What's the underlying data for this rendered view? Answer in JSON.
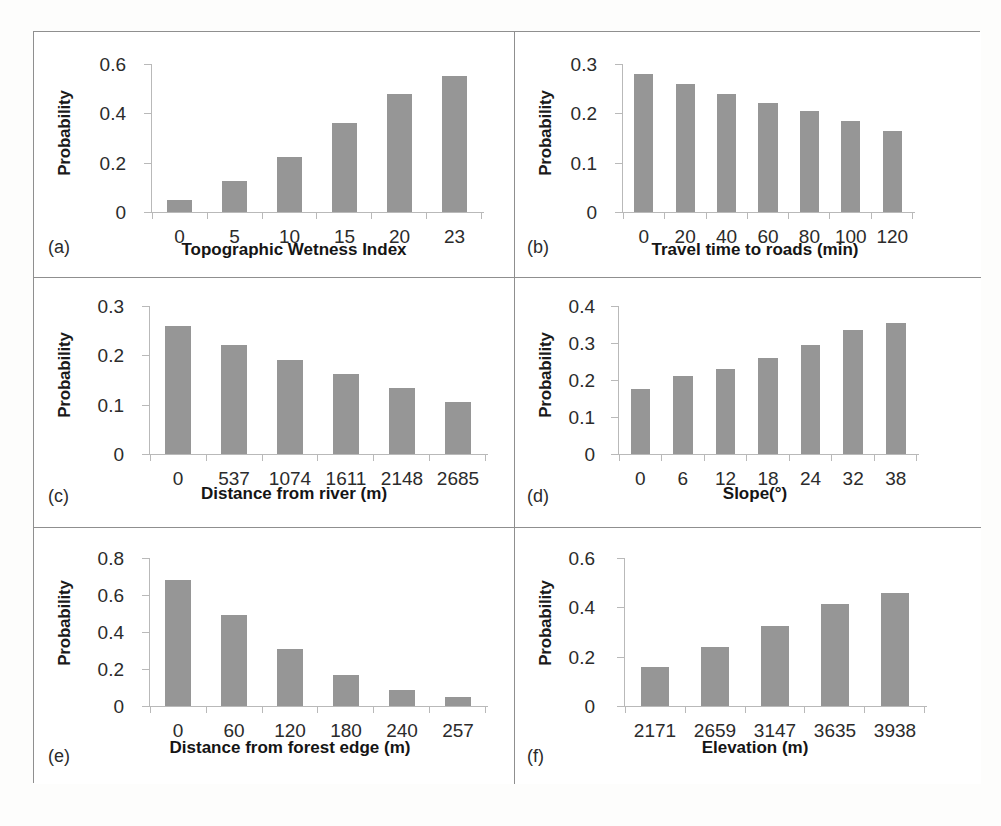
{
  "figure": {
    "panel_count": 6,
    "bar_color": "#969696",
    "axis_color": "#b9b9b9",
    "border_color": "#8f8f8f",
    "shared_ylabel": "Probability"
  },
  "chart_data": [
    {
      "id": "a",
      "tag": "(a)",
      "type": "bar",
      "title": "",
      "xlabel": "Topographic Wetness Index",
      "ylabel": "Probability",
      "categories": [
        "0",
        "5",
        "10",
        "15",
        "20",
        "23"
      ],
      "values": [
        0.05,
        0.125,
        0.225,
        0.36,
        0.48,
        0.55
      ],
      "yticks": [
        "0",
        "0.2",
        "0.4",
        "0.6"
      ],
      "ytick_values": [
        0,
        0.2,
        0.4,
        0.6
      ],
      "ylim": [
        0,
        0.6
      ],
      "grid": false,
      "legend": "none"
    },
    {
      "id": "b",
      "tag": "(b)",
      "type": "bar",
      "title": "",
      "xlabel": "Travel time to roads (min)",
      "ylabel": "Probability",
      "categories": [
        "0",
        "20",
        "40",
        "60",
        "80",
        "100",
        "120"
      ],
      "values": [
        0.28,
        0.26,
        0.24,
        0.22,
        0.205,
        0.185,
        0.165
      ],
      "yticks": [
        "0",
        "0.1",
        "0.2",
        "0.3"
      ],
      "ytick_values": [
        0,
        0.1,
        0.2,
        0.3
      ],
      "ylim": [
        0,
        0.3
      ],
      "grid": false,
      "legend": "none"
    },
    {
      "id": "c",
      "tag": "(c)",
      "type": "bar",
      "title": "",
      "xlabel": "Distance from river (m)",
      "ylabel": "Probability",
      "categories": [
        "0",
        "537",
        "1074",
        "1611",
        "2148",
        "2685"
      ],
      "values": [
        0.26,
        0.22,
        0.19,
        0.163,
        0.133,
        0.105
      ],
      "yticks": [
        "0",
        "0.1",
        "0.2",
        "0.3"
      ],
      "ytick_values": [
        0,
        0.1,
        0.2,
        0.3
      ],
      "ylim": [
        0,
        0.3
      ],
      "grid": false,
      "legend": "none"
    },
    {
      "id": "d",
      "tag": "(d)",
      "type": "bar",
      "title": "",
      "xlabel": "Slope(°)",
      "ylabel": "Probability",
      "categories": [
        "0",
        "6",
        "12",
        "18",
        "24",
        "32",
        "38"
      ],
      "values": [
        0.175,
        0.21,
        0.23,
        0.26,
        0.295,
        0.335,
        0.355
      ],
      "yticks": [
        "0",
        "0.1",
        "0.2",
        "0.3",
        "0.4"
      ],
      "ytick_values": [
        0,
        0.1,
        0.2,
        0.3,
        0.4
      ],
      "ylim": [
        0,
        0.4
      ],
      "grid": false,
      "legend": "none"
    },
    {
      "id": "e",
      "tag": "(e)",
      "type": "bar",
      "title": "",
      "xlabel": "Distance from forest edge (m)",
      "ylabel": "Probability",
      "categories": [
        "0",
        "60",
        "120",
        "180",
        "240",
        "257"
      ],
      "values": [
        0.68,
        0.49,
        0.31,
        0.17,
        0.085,
        0.05
      ],
      "yticks": [
        "0",
        "0.2",
        "0.4",
        "0.6",
        "0.8"
      ],
      "ytick_values": [
        0,
        0.2,
        0.4,
        0.6,
        0.8
      ],
      "ylim": [
        0,
        0.8
      ],
      "grid": false,
      "legend": "none"
    },
    {
      "id": "f",
      "tag": "(f)",
      "type": "bar",
      "title": "",
      "xlabel": "Elevation (m)",
      "ylabel": "Probability",
      "categories": [
        "2171",
        "2659",
        "3147",
        "3635",
        "3938"
      ],
      "values": [
        0.16,
        0.24,
        0.325,
        0.415,
        0.46
      ],
      "yticks": [
        "0",
        "0.2",
        "0.4",
        "0.6"
      ],
      "ytick_values": [
        0,
        0.2,
        0.4,
        0.6
      ],
      "ylim": [
        0,
        0.6
      ],
      "grid": false,
      "legend": "none"
    }
  ]
}
